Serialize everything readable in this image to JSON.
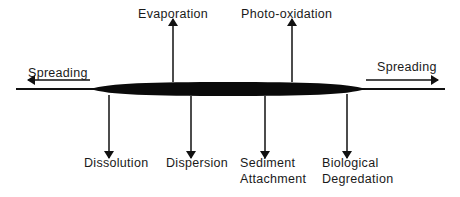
{
  "diagram": {
    "type": "process-diagram",
    "colors": {
      "ink": "#111111",
      "background": "#ffffff"
    },
    "horizontal": {
      "left": {
        "label": "Spreading",
        "direction": "left"
      },
      "right": {
        "label": "Spreading",
        "direction": "right"
      }
    },
    "upward": [
      {
        "label": "Evaporation"
      },
      {
        "label": "Photo-oxidation"
      }
    ],
    "downward": [
      {
        "label": "Dissolution"
      },
      {
        "label": "Dispersion"
      },
      {
        "label_line1": "Sediment",
        "label_line2": "Attachment"
      },
      {
        "label_line1": "Biological",
        "label_line2": "Degredation"
      }
    ]
  }
}
